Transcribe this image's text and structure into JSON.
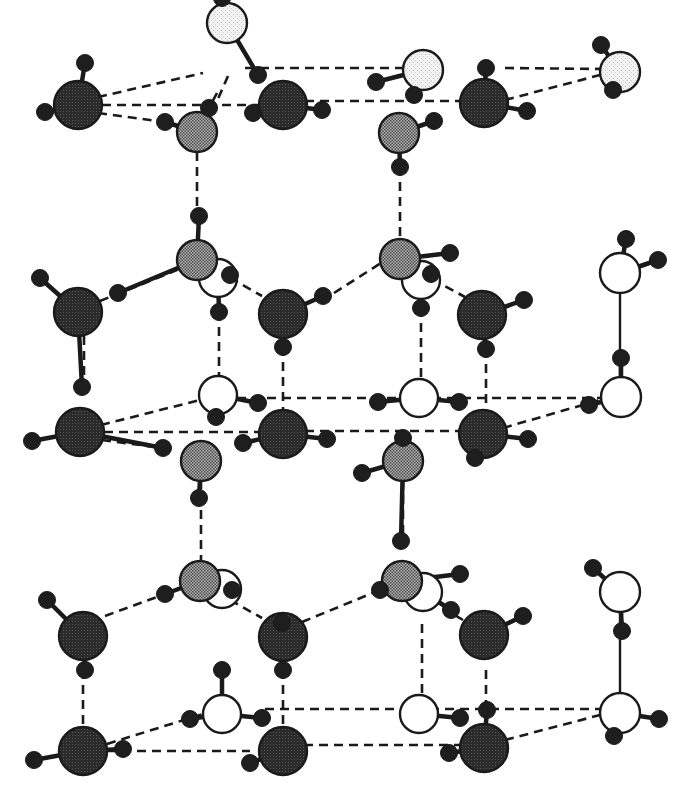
{
  "diagram": {
    "title": "",
    "colors": {
      "background": "#ffffff",
      "stroke": "#1a1a1a",
      "hydrogen": "#1e1e1e",
      "oxygen_dark": "#2b2b2b",
      "oxygen_medium": "#8f8f8f",
      "oxygen_light": "#ececec",
      "oxygen_white": "#ffffff"
    },
    "legend": [],
    "oxygens": [
      {
        "id": "o1",
        "x": 227,
        "y": 23,
        "r": 20,
        "type": "light"
      },
      {
        "id": "o2",
        "x": 423,
        "y": 70,
        "r": 20,
        "type": "light"
      },
      {
        "id": "o3",
        "x": 620,
        "y": 72,
        "r": 20,
        "type": "light"
      },
      {
        "id": "o4",
        "x": 78,
        "y": 105,
        "r": 24,
        "type": "dark"
      },
      {
        "id": "o5",
        "x": 283,
        "y": 105,
        "r": 24,
        "type": "dark"
      },
      {
        "id": "o6",
        "x": 484,
        "y": 103,
        "r": 24,
        "type": "dark"
      },
      {
        "id": "o7",
        "x": 197,
        "y": 132,
        "r": 20,
        "type": "medium"
      },
      {
        "id": "o8",
        "x": 399,
        "y": 133,
        "r": 20,
        "type": "medium"
      },
      {
        "id": "o9",
        "x": 218,
        "y": 278,
        "r": 19,
        "type": "white"
      },
      {
        "id": "o10",
        "x": 421,
        "y": 280,
        "r": 19,
        "type": "white"
      },
      {
        "id": "o11",
        "x": 620,
        "y": 273,
        "r": 20,
        "type": "white"
      },
      {
        "id": "o12",
        "x": 197,
        "y": 260,
        "r": 20,
        "type": "medium"
      },
      {
        "id": "o13",
        "x": 400,
        "y": 259,
        "r": 20,
        "type": "medium"
      },
      {
        "id": "o14",
        "x": 78,
        "y": 312,
        "r": 24,
        "type": "dark"
      },
      {
        "id": "o15",
        "x": 283,
        "y": 314,
        "r": 24,
        "type": "dark"
      },
      {
        "id": "o16",
        "x": 482,
        "y": 315,
        "r": 24,
        "type": "dark"
      },
      {
        "id": "o17",
        "x": 218,
        "y": 395,
        "r": 19,
        "type": "white"
      },
      {
        "id": "o18",
        "x": 419,
        "y": 398,
        "r": 19,
        "type": "white"
      },
      {
        "id": "o19",
        "x": 621,
        "y": 397,
        "r": 20,
        "type": "white"
      },
      {
        "id": "o20",
        "x": 80,
        "y": 432,
        "r": 24,
        "type": "dark"
      },
      {
        "id": "o21",
        "x": 283,
        "y": 434,
        "r": 24,
        "type": "dark"
      },
      {
        "id": "o22",
        "x": 483,
        "y": 434,
        "r": 24,
        "type": "dark"
      },
      {
        "id": "o23",
        "x": 201,
        "y": 461,
        "r": 20,
        "type": "medium"
      },
      {
        "id": "o24",
        "x": 403,
        "y": 461,
        "r": 20,
        "type": "medium"
      },
      {
        "id": "o25",
        "x": 222,
        "y": 589,
        "r": 19,
        "type": "white"
      },
      {
        "id": "o26",
        "x": 423,
        "y": 592,
        "r": 19,
        "type": "white"
      },
      {
        "id": "o27",
        "x": 620,
        "y": 592,
        "r": 20,
        "type": "white"
      },
      {
        "id": "o28",
        "x": 200,
        "y": 581,
        "r": 20,
        "type": "medium"
      },
      {
        "id": "o29",
        "x": 402,
        "y": 581,
        "r": 20,
        "type": "medium"
      },
      {
        "id": "o30",
        "x": 83,
        "y": 636,
        "r": 24,
        "type": "dark"
      },
      {
        "id": "o31",
        "x": 283,
        "y": 637,
        "r": 24,
        "type": "dark"
      },
      {
        "id": "o32",
        "x": 484,
        "y": 635,
        "r": 24,
        "type": "dark"
      },
      {
        "id": "o33",
        "x": 222,
        "y": 714,
        "r": 19,
        "type": "white"
      },
      {
        "id": "o34",
        "x": 419,
        "y": 714,
        "r": 19,
        "type": "white"
      },
      {
        "id": "o35",
        "x": 620,
        "y": 713,
        "r": 20,
        "type": "white"
      },
      {
        "id": "o36",
        "x": 83,
        "y": 751,
        "r": 24,
        "type": "dark"
      },
      {
        "id": "o37",
        "x": 283,
        "y": 751,
        "r": 24,
        "type": "dark"
      },
      {
        "id": "o38",
        "x": 484,
        "y": 748,
        "r": 24,
        "type": "dark"
      }
    ],
    "hydrogens": [
      {
        "x": 222,
        "y": -2,
        "from": "o1"
      },
      {
        "x": 258,
        "y": 75,
        "from": "o1"
      },
      {
        "x": 376,
        "y": 82,
        "from": "o2"
      },
      {
        "x": 414,
        "y": 95,
        "from": "o2"
      },
      {
        "x": 601,
        "y": 45,
        "from": "o3"
      },
      {
        "x": 613,
        "y": 90,
        "from": "o3"
      },
      {
        "x": 85,
        "y": 63,
        "from": "o4"
      },
      {
        "x": 45,
        "y": 112,
        "from": "o4"
      },
      {
        "x": 253,
        "y": 113,
        "from": "o5"
      },
      {
        "x": 322,
        "y": 110,
        "from": "o5"
      },
      {
        "x": 486,
        "y": 68,
        "from": "o6"
      },
      {
        "x": 527,
        "y": 111,
        "from": "o6"
      },
      {
        "x": 165,
        "y": 122,
        "from": "o7"
      },
      {
        "x": 209,
        "y": 108,
        "from": "o7"
      },
      {
        "x": 434,
        "y": 121,
        "from": "o8"
      },
      {
        "x": 400,
        "y": 167,
        "from": "o8"
      },
      {
        "x": 199,
        "y": 216,
        "from": "o12"
      },
      {
        "x": 118,
        "y": 293,
        "from": "o12"
      },
      {
        "x": 230,
        "y": 275,
        "from": "o9"
      },
      {
        "x": 219,
        "y": 312,
        "from": "o9"
      },
      {
        "x": 450,
        "y": 253,
        "from": "o13"
      },
      {
        "x": 431,
        "y": 274,
        "from": "o13"
      },
      {
        "x": 421,
        "y": 308,
        "from": "o10"
      },
      {
        "x": 626,
        "y": 239,
        "from": "o11"
      },
      {
        "x": 658,
        "y": 260,
        "from": "o11"
      },
      {
        "x": 40,
        "y": 278,
        "from": "o14"
      },
      {
        "x": 82,
        "y": 387,
        "from": "o14"
      },
      {
        "x": 323,
        "y": 296,
        "from": "o15"
      },
      {
        "x": 283,
        "y": 347,
        "from": "o15"
      },
      {
        "x": 524,
        "y": 300,
        "from": "o16"
      },
      {
        "x": 486,
        "y": 349,
        "from": "o16"
      },
      {
        "x": 621,
        "y": 358,
        "from": "o19"
      },
      {
        "x": 216,
        "y": 417,
        "from": "o17"
      },
      {
        "x": 258,
        "y": 403,
        "from": "o17"
      },
      {
        "x": 378,
        "y": 402,
        "from": "o18"
      },
      {
        "x": 459,
        "y": 402,
        "from": "o18"
      },
      {
        "x": 589,
        "y": 405,
        "from": "o19"
      },
      {
        "x": 32,
        "y": 441,
        "from": "o20"
      },
      {
        "x": 163,
        "y": 448,
        "from": "o20"
      },
      {
        "x": 243,
        "y": 443,
        "from": "o21"
      },
      {
        "x": 327,
        "y": 439,
        "from": "o21"
      },
      {
        "x": 475,
        "y": 458,
        "from": "o22"
      },
      {
        "x": 528,
        "y": 439,
        "from": "o22"
      },
      {
        "x": 403,
        "y": 438,
        "from": "o24"
      },
      {
        "x": 362,
        "y": 473,
        "from": "o24"
      },
      {
        "x": 199,
        "y": 498,
        "from": "o23"
      },
      {
        "x": 401,
        "y": 541,
        "from": "o24"
      },
      {
        "x": 165,
        "y": 594,
        "from": "o28"
      },
      {
        "x": 232,
        "y": 590,
        "from": "o25"
      },
      {
        "x": 380,
        "y": 590,
        "from": "o29"
      },
      {
        "x": 460,
        "y": 574,
        "from": "o29"
      },
      {
        "x": 451,
        "y": 610,
        "from": "o26"
      },
      {
        "x": 593,
        "y": 568,
        "from": "o27"
      },
      {
        "x": 47,
        "y": 600,
        "from": "o30"
      },
      {
        "x": 85,
        "y": 670,
        "from": "o30"
      },
      {
        "x": 283,
        "y": 670,
        "from": "o31"
      },
      {
        "x": 282,
        "y": 623,
        "from": "o31"
      },
      {
        "x": 523,
        "y": 616,
        "from": "o32"
      },
      {
        "x": 622,
        "y": 631,
        "from": "o27"
      },
      {
        "x": 222,
        "y": 670,
        "from": "o33"
      },
      {
        "x": 190,
        "y": 719,
        "from": "o33"
      },
      {
        "x": 262,
        "y": 718,
        "from": "o33"
      },
      {
        "x": 418,
        "y:": 0,
        "y2": 0,
        "from": "o34"
      },
      {
        "x": 460,
        "y": 718,
        "from": "o34"
      },
      {
        "x": 487,
        "y": 710,
        "from": "o38"
      },
      {
        "x": 659,
        "y": 719,
        "from": "o35"
      },
      {
        "x": 614,
        "y": 736,
        "from": "o35"
      },
      {
        "x": 34,
        "y": 760,
        "from": "o36"
      },
      {
        "x": 123,
        "y": 749,
        "from": "o36"
      },
      {
        "x": 250,
        "y": 763,
        "from": "o37"
      },
      {
        "x": 449,
        "y": 753,
        "from": "o38"
      }
    ],
    "hbonds_dashed": [
      [
        98,
        97,
        203,
        73
      ],
      [
        102,
        105,
        283,
        105
      ],
      [
        98,
        113,
        165,
        122
      ],
      [
        245,
        68,
        410,
        68
      ],
      [
        505,
        68,
        605,
        69
      ],
      [
        305,
        101,
        460,
        101
      ],
      [
        505,
        100,
        600,
        75
      ],
      [
        217,
        93,
        209,
        108
      ],
      [
        228,
        76,
        214,
        108
      ],
      [
        197,
        152,
        197,
        216
      ],
      [
        400,
        167,
        400,
        240
      ],
      [
        100,
        301,
        197,
        262
      ],
      [
        217,
        270,
        262,
        296
      ],
      [
        334,
        293,
        381,
        263
      ],
      [
        419,
        272,
        465,
        297
      ],
      [
        219,
        312,
        219,
        376
      ],
      [
        84,
        336,
        84,
        387
      ],
      [
        283,
        347,
        283,
        414
      ],
      [
        486,
        349,
        486,
        418
      ],
      [
        421,
        308,
        421,
        379
      ],
      [
        101,
        425,
        200,
        400
      ],
      [
        104,
        432,
        283,
        432
      ],
      [
        102,
        440,
        163,
        448
      ],
      [
        237,
        398,
        600,
        398
      ],
      [
        305,
        431,
        462,
        431
      ],
      [
        503,
        428,
        600,
        400
      ],
      [
        201,
        480,
        201,
        565
      ],
      [
        403,
        480,
        403,
        541
      ],
      [
        105,
        616,
        165,
        594
      ],
      [
        230,
        600,
        262,
        618
      ],
      [
        302,
        622,
        380,
        590
      ],
      [
        430,
        600,
        463,
        620
      ],
      [
        83,
        670,
        83,
        727
      ],
      [
        222,
        670,
        222,
        695
      ],
      [
        283,
        670,
        283,
        727
      ],
      [
        486,
        670,
        486,
        710
      ],
      [
        422,
        624,
        422,
        695
      ],
      [
        107,
        744,
        203,
        714
      ],
      [
        107,
        751,
        250,
        751
      ],
      [
        265,
        709,
        600,
        709
      ],
      [
        304,
        745,
        463,
        745
      ],
      [
        505,
        740,
        600,
        715
      ]
    ],
    "covalent_solid": [
      [
        620,
        294,
        620,
        376
      ],
      [
        620,
        612,
        620,
        693
      ]
    ]
  }
}
